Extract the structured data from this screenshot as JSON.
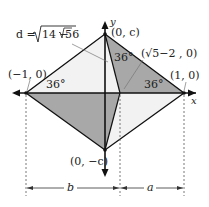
{
  "labels": {
    "d_formula": "d = √14 − 6√5",
    "d_prefix": "d = ",
    "d_rad1": "14 − 6",
    "d_rad2": "5",
    "top_vertex": "(0, c)",
    "left_vertex": "(−1, 0)",
    "right_vertex": "(1, 0)",
    "bottom_vertex": "(0, −c)",
    "inner_point": "(√5−2 , 0)",
    "angle_left": "36°",
    "angle_top": "36°",
    "angle_right": "36°",
    "axis_x": "x",
    "axis_y": "y",
    "dim_b": "b",
    "dim_a": "a"
  },
  "colors": {
    "shade": "#a9a9a9",
    "light": "#f0f0f0",
    "line": "#111111"
  }
}
